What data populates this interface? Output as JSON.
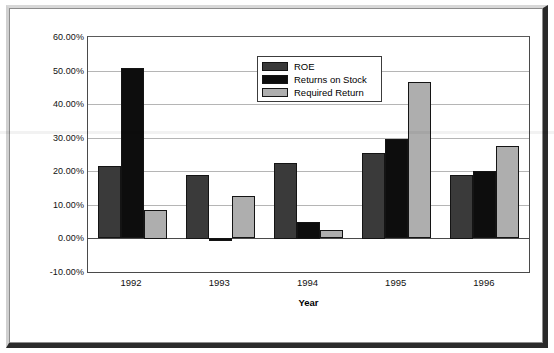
{
  "chart_data": {
    "type": "bar",
    "title": "",
    "xlabel": "Year",
    "ylabel": "",
    "categories": [
      "1992",
      "1993",
      "1994",
      "1995",
      "1996"
    ],
    "series": [
      {
        "name": "ROE",
        "color": "#3a3a3a",
        "values": [
          21.5,
          19.0,
          22.5,
          25.5,
          19.0
        ]
      },
      {
        "name": "Returns on Stock",
        "color": "#0d0d0d",
        "values": [
          50.7,
          -1.0,
          5.0,
          29.5,
          20.0
        ]
      },
      {
        "name": "Required Return",
        "color": "#aeaeae",
        "values": [
          8.5,
          12.5,
          2.5,
          46.5,
          27.5
        ]
      }
    ],
    "ylim": [
      -10,
      60
    ],
    "ytick_step": 10,
    "ytick_labels": [
      "60.00%",
      "50.00%",
      "40.00%",
      "30.00%",
      "20.00%",
      "10.00%",
      "0.00%",
      "-10.00%"
    ],
    "ytick_values": [
      60,
      50,
      40,
      30,
      20,
      10,
      0,
      -10
    ],
    "grid": true,
    "legend_position": "top-center"
  },
  "legend": {
    "items": [
      {
        "label": "ROE",
        "swatch": "roe"
      },
      {
        "label": "Returns on Stock",
        "swatch": "stock"
      },
      {
        "label": "Required Return",
        "swatch": "required"
      }
    ]
  },
  "axis": {
    "x_title": "Year"
  }
}
